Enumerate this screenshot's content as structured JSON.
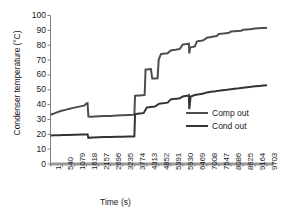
{
  "chart_data": {
    "type": "line",
    "title": "",
    "xlabel": "Time (s)",
    "ylabel": "Condenser temperature (°C)",
    "xlim": [
      1,
      9703
    ],
    "ylim": [
      0,
      100
    ],
    "ytick_labels": [
      "100",
      "90",
      "80",
      "70",
      "60",
      "50",
      "40",
      "30",
      "20",
      "10",
      "0"
    ],
    "ytick_values": [
      100,
      90,
      80,
      70,
      60,
      50,
      40,
      30,
      20,
      10,
      0
    ],
    "xtick_labels": [
      "1",
      "540",
      "1079",
      "1618",
      "2157",
      "2696",
      "3235",
      "3774",
      "4313",
      "4852",
      "5391",
      "5930",
      "6469",
      "7008",
      "7547",
      "8086",
      "8625",
      "9164",
      "9703"
    ],
    "xtick_values": [
      1,
      540,
      1079,
      1618,
      2157,
      2696,
      3235,
      3774,
      4313,
      4852,
      5391,
      5930,
      6469,
      7008,
      7547,
      8086,
      8625,
      9164,
      9703
    ],
    "grid": false,
    "legend_position": "center-right",
    "series": [
      {
        "name": "Comp out",
        "color": "#4d4d4d",
        "x": [
          1,
          120,
          260,
          400,
          540,
          700,
          860,
          1020,
          1180,
          1340,
          1500,
          1618,
          1660,
          1700,
          1760,
          1860,
          1980,
          2157,
          2400,
          2696,
          2950,
          3235,
          3500,
          3700,
          3760,
          3790,
          3820,
          3900,
          4000,
          4100,
          4180,
          4220,
          4260,
          4300,
          4313,
          4400,
          4500,
          4560,
          4620,
          4700,
          4800,
          4852,
          4950,
          5050,
          5150,
          5250,
          5391,
          5500,
          5620,
          5700,
          5800,
          5930,
          6000,
          6100,
          6180,
          6200,
          6220,
          6260,
          6320,
          6400,
          6469,
          6560,
          6650,
          6750,
          6850,
          7008,
          7150,
          7300,
          7450,
          7547,
          7700,
          7850,
          8000,
          8086,
          8250,
          8400,
          8550,
          8625,
          8800,
          8950,
          9100,
          9164,
          9320,
          9470,
          9600,
          9703
        ],
        "y": [
          33.2,
          33.8,
          34.6,
          35.4,
          36.0,
          36.6,
          37.2,
          37.8,
          38.3,
          38.8,
          39.3,
          40.8,
          41.0,
          32.0,
          31.8,
          31.9,
          32.0,
          32.1,
          32.3,
          32.4,
          32.6,
          32.8,
          33.0,
          33.2,
          33.3,
          46.0,
          46.0,
          46.1,
          46.2,
          46.3,
          46.4,
          46.5,
          63.5,
          63.6,
          63.7,
          63.8,
          63.9,
          57.5,
          57.5,
          57.6,
          57.7,
          70.5,
          74.0,
          74.2,
          74.4,
          74.6,
          76.5,
          76.8,
          77.0,
          77.2,
          77.5,
          80.5,
          80.6,
          80.8,
          81.0,
          81.1,
          74.5,
          78.5,
          78.7,
          78.9,
          79.2,
          82.5,
          82.8,
          83.0,
          83.3,
          85.0,
          85.4,
          85.8,
          86.2,
          87.5,
          87.8,
          88.1,
          88.4,
          89.2,
          89.4,
          89.6,
          89.8,
          90.4,
          90.6,
          90.8,
          91.0,
          91.3,
          91.4,
          91.5,
          91.6,
          91.8
        ]
      },
      {
        "name": "Cond out",
        "color": "#333333",
        "x": [
          1,
          200,
          400,
          540,
          800,
          1100,
          1400,
          1618,
          1660,
          1700,
          1900,
          2157,
          2400,
          2696,
          3000,
          3235,
          3500,
          3700,
          3760,
          3790,
          3820,
          3900,
          4000,
          4100,
          4180,
          4313,
          4400,
          4500,
          4600,
          4700,
          4852,
          4950,
          5100,
          5250,
          5391,
          5500,
          5650,
          5800,
          5930,
          6050,
          6180,
          6200,
          6220,
          6280,
          6350,
          6469,
          6600,
          6750,
          6900,
          7008,
          7200,
          7400,
          7547,
          7700,
          7900,
          8086,
          8250,
          8450,
          8625,
          8800,
          9000,
          9164,
          9350,
          9550,
          9703
        ],
        "y": [
          19.2,
          19.3,
          19.4,
          19.5,
          19.6,
          19.7,
          19.8,
          19.9,
          20.0,
          17.6,
          17.8,
          18.0,
          18.1,
          18.2,
          18.3,
          18.4,
          18.5,
          18.6,
          18.7,
          33.5,
          33.6,
          33.8,
          34.0,
          34.2,
          34.4,
          38.0,
          38.2,
          38.4,
          38.6,
          38.8,
          40.5,
          40.7,
          41.0,
          41.3,
          43.5,
          43.7,
          44.0,
          44.3,
          45.5,
          45.8,
          46.1,
          46.3,
          37.0,
          45.5,
          45.8,
          46.5,
          46.8,
          47.2,
          47.6,
          48.2,
          48.6,
          49.0,
          49.4,
          49.7,
          50.0,
          50.4,
          50.7,
          51.0,
          51.4,
          51.7,
          52.0,
          52.3,
          52.6,
          52.9,
          53.1
        ]
      }
    ]
  },
  "legend": {
    "items": [
      {
        "label": "Comp out"
      },
      {
        "label": "Cond out"
      }
    ]
  },
  "colors": {
    "comp_out": "#4d4d4d",
    "cond_out": "#333333",
    "axis": "#808080",
    "text": "#1a1a1a"
  }
}
